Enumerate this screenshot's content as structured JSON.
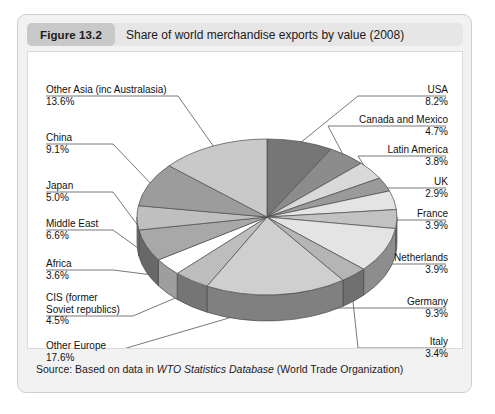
{
  "figure": {
    "badge": "Figure 13.2",
    "caption": "Share of world merchandise exports by value (2008)",
    "source_prefix": "Source: Based on data in ",
    "source_italic": "WTO Statistics Database",
    "source_suffix": " (World Trade Organization)"
  },
  "chart_data": {
    "type": "pie",
    "title": "Share of world merchandise exports by value (2008)",
    "value_unit": "percent",
    "start_angle_deg": 0,
    "direction": "clockwise",
    "three_d": true,
    "legend_position": "leader-labels",
    "categories": [
      "USA",
      "Canada and Mexico",
      "Latin America",
      "UK",
      "France",
      "Netherlands",
      "Germany",
      "Italy",
      "Other Europe",
      "CIS (former Soviet republics)",
      "Africa",
      "Middle East",
      "Japan",
      "China",
      "Other Asia (inc Australasia)"
    ],
    "values": [
      8.2,
      4.7,
      3.8,
      2.9,
      3.9,
      3.9,
      9.3,
      3.4,
      17.6,
      4.5,
      3.6,
      6.6,
      5.0,
      9.1,
      13.6
    ],
    "value_labels": [
      "8.2%",
      "4.7%",
      "3.8%",
      "2.9%",
      "3.9%",
      "3.9%",
      "9.3%",
      "3.4%",
      "17.6%",
      "4.5%",
      "3.6%",
      "6.6%",
      "5.0%",
      "9.1%",
      "13.6%"
    ],
    "slice_colors": [
      "#767676",
      "#8c8c8c",
      "#d9d9d9",
      "#9a9a9a",
      "#e4e4e4",
      "#c2c2c2",
      "#e4e4e4",
      "#b5b5b5",
      "#cfcfcf",
      "#bdbdbd",
      "#ffffff",
      "#a8a8a8",
      "#bfbfbf",
      "#9c9c9c",
      "#c9c9c9"
    ]
  },
  "labels": {
    "left": [
      {
        "name": "Other Asia (inc Australasia)",
        "pct": "13.6%"
      },
      {
        "name": "China",
        "pct": "9.1%"
      },
      {
        "name": "Japan",
        "pct": "5.0%"
      },
      {
        "name": "Middle East",
        "pct": "6.6%"
      },
      {
        "name": "Africa",
        "pct": "3.6%"
      },
      {
        "name": "CIS (former",
        "name2": "Soviet republics)",
        "pct": "4.5%"
      },
      {
        "name": "Other Europe",
        "pct": "17.6%"
      }
    ],
    "right": [
      {
        "name": "USA",
        "pct": "8.2%"
      },
      {
        "name": "Canada and Mexico",
        "pct": "4.7%"
      },
      {
        "name": "Latin America",
        "pct": "3.8%"
      },
      {
        "name": "UK",
        "pct": "2.9%"
      },
      {
        "name": "France",
        "pct": "3.9%"
      },
      {
        "name": "Netherlands",
        "pct": "3.9%"
      },
      {
        "name": "Germany",
        "pct": "9.3%"
      },
      {
        "name": "Italy",
        "pct": "3.4%"
      }
    ]
  }
}
